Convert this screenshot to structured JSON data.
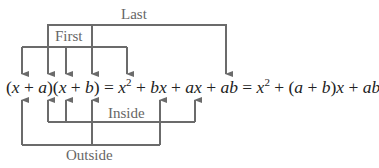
{
  "diagram": {
    "labels": {
      "last": "Last",
      "first": "First",
      "inside": "Inside",
      "outside": "Outside"
    },
    "equation": {
      "lhs": "(x + a)(x + b)",
      "expanded": "x^2 + bx + ax + ab",
      "result": "x^2 + (a + b)x + ab",
      "text": "(x + a)(x + b) = x² + bx + ax + ab = x² + (a + b)x + ab"
    },
    "connections": [
      {
        "label": "First",
        "from": "x (first factor)",
        "also": "x (second factor)",
        "to": "x^2"
      },
      {
        "label": "Last",
        "from": "a",
        "also": "b",
        "to": "ab"
      },
      {
        "label": "Inside",
        "from": "a",
        "also": "x (second factor)",
        "to": "ax"
      },
      {
        "label": "Outside",
        "from": "x (first factor)",
        "also": "b",
        "to": "bx"
      }
    ],
    "line_color": "#6b6b6b",
    "text_color": "#222222"
  }
}
